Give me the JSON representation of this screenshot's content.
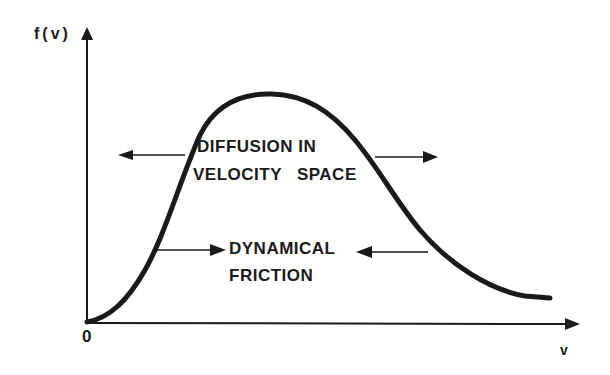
{
  "figure": {
    "y_axis_label": "f(v)",
    "x_axis_label": "v",
    "origin_label": "0",
    "curve": "maxwellian-like velocity distribution f(v)",
    "annotations": {
      "diffusion_line1": "DIFFUSION IN",
      "diffusion_line2": "VELOCITY SPACE",
      "friction_line1": "DYNAMICAL",
      "friction_line2": "FRICTION"
    },
    "arrows": {
      "diffusion": "outward (left and right)",
      "friction": "inward (toward center)"
    },
    "colors": {
      "ink": "#1a1a1a",
      "background": "#ffffff"
    }
  }
}
